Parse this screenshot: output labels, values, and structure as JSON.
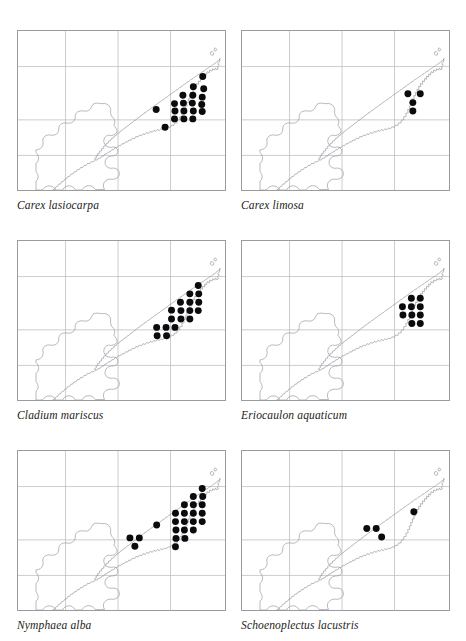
{
  "page": {
    "header_sliver_left": "",
    "header_sliver_mid": "",
    "header_sliver_right": "",
    "background_color": "#ffffff"
  },
  "style": {
    "dot_color": "#0b0b0d",
    "coastline_color": "#8e8e96",
    "gridline_color": "#b6b6bd",
    "panel_border_color": "#9a9aa2",
    "caption_color": "#1d1d20"
  },
  "map": {
    "type": "dot-distribution",
    "projection_grid": {
      "vertical_gridlines_x": [
        48,
        101,
        154
      ],
      "horizontal_gridlines_y": [
        36,
        90,
        126
      ],
      "grid_visible": true
    },
    "view_box": "0 0 209 161",
    "region_note": "archipelago outline: elongated NE-trending island plus south-western landmass"
  },
  "panels": [
    {
      "index": 1,
      "caption": "Carex lasiocarpa",
      "dot_count": 19,
      "dots": [
        {
          "x": 186.5,
          "y": 46.0
        },
        {
          "x": 177.0,
          "y": 56.5
        },
        {
          "x": 187.5,
          "y": 58.5
        },
        {
          "x": 166.5,
          "y": 65.0
        },
        {
          "x": 176.5,
          "y": 65.0
        },
        {
          "x": 186.0,
          "y": 67.0
        },
        {
          "x": 158.0,
          "y": 73.5
        },
        {
          "x": 167.0,
          "y": 73.0
        },
        {
          "x": 176.0,
          "y": 73.0
        },
        {
          "x": 185.5,
          "y": 74.5
        },
        {
          "x": 139.5,
          "y": 79.5
        },
        {
          "x": 158.5,
          "y": 81.0
        },
        {
          "x": 167.5,
          "y": 81.0
        },
        {
          "x": 177.0,
          "y": 81.0
        },
        {
          "x": 186.0,
          "y": 81.5
        },
        {
          "x": 158.0,
          "y": 89.0
        },
        {
          "x": 167.5,
          "y": 89.0
        },
        {
          "x": 176.5,
          "y": 89.0
        },
        {
          "x": 148.5,
          "y": 97.5
        }
      ]
    },
    {
      "index": 2,
      "caption": "Carex limosa",
      "dot_count": 4,
      "dots": [
        {
          "x": 167.5,
          "y": 63.5
        },
        {
          "x": 180.0,
          "y": 63.5
        },
        {
          "x": 172.5,
          "y": 72.5
        },
        {
          "x": 172.5,
          "y": 81.0
        }
      ]
    },
    {
      "index": 3,
      "caption": "Cladium mariscus",
      "dot_count": 18,
      "dots": [
        {
          "x": 182.0,
          "y": 45.0
        },
        {
          "x": 173.5,
          "y": 53.5
        },
        {
          "x": 182.5,
          "y": 53.5
        },
        {
          "x": 164.0,
          "y": 62.0
        },
        {
          "x": 173.5,
          "y": 62.0
        },
        {
          "x": 182.5,
          "y": 62.0
        },
        {
          "x": 155.0,
          "y": 70.0
        },
        {
          "x": 164.5,
          "y": 70.5
        },
        {
          "x": 173.5,
          "y": 70.5
        },
        {
          "x": 182.0,
          "y": 70.5
        },
        {
          "x": 155.0,
          "y": 79.0
        },
        {
          "x": 164.5,
          "y": 79.0
        },
        {
          "x": 173.5,
          "y": 79.0
        },
        {
          "x": 140.0,
          "y": 87.5
        },
        {
          "x": 149.5,
          "y": 87.5
        },
        {
          "x": 158.5,
          "y": 87.5
        },
        {
          "x": 140.5,
          "y": 96.0
        },
        {
          "x": 150.0,
          "y": 96.0
        }
      ]
    },
    {
      "index": 4,
      "caption": "Eriocaulon aquaticum",
      "dot_count": 10,
      "dots": [
        {
          "x": 171.0,
          "y": 58.0
        },
        {
          "x": 180.0,
          "y": 58.0
        },
        {
          "x": 162.0,
          "y": 66.5
        },
        {
          "x": 171.0,
          "y": 66.5
        },
        {
          "x": 180.0,
          "y": 66.5
        },
        {
          "x": 162.5,
          "y": 75.0
        },
        {
          "x": 171.5,
          "y": 75.0
        },
        {
          "x": 180.0,
          "y": 75.0
        },
        {
          "x": 171.5,
          "y": 83.5
        },
        {
          "x": 180.0,
          "y": 83.5
        }
      ]
    },
    {
      "index": 5,
      "caption": "Nymphaea alba",
      "dot_count": 24,
      "dots": [
        {
          "x": 186.0,
          "y": 38.0
        },
        {
          "x": 177.0,
          "y": 46.0
        },
        {
          "x": 186.5,
          "y": 46.0
        },
        {
          "x": 168.0,
          "y": 54.5
        },
        {
          "x": 177.0,
          "y": 54.5
        },
        {
          "x": 186.0,
          "y": 54.5
        },
        {
          "x": 159.0,
          "y": 63.0
        },
        {
          "x": 168.0,
          "y": 63.0
        },
        {
          "x": 177.0,
          "y": 63.0
        },
        {
          "x": 186.0,
          "y": 63.0
        },
        {
          "x": 159.0,
          "y": 71.5
        },
        {
          "x": 168.0,
          "y": 71.5
        },
        {
          "x": 177.0,
          "y": 71.5
        },
        {
          "x": 186.0,
          "y": 71.5
        },
        {
          "x": 140.0,
          "y": 75.0
        },
        {
          "x": 159.5,
          "y": 80.0
        },
        {
          "x": 168.0,
          "y": 80.0
        },
        {
          "x": 177.0,
          "y": 80.0
        },
        {
          "x": 113.0,
          "y": 88.0
        },
        {
          "x": 122.5,
          "y": 88.0
        },
        {
          "x": 159.5,
          "y": 88.5
        },
        {
          "x": 168.5,
          "y": 88.5
        },
        {
          "x": 118.0,
          "y": 96.5
        },
        {
          "x": 159.0,
          "y": 97.0
        }
      ]
    },
    {
      "index": 6,
      "caption": "Schoenoplectus lacustris",
      "dot_count": 4,
      "dots": [
        {
          "x": 173.5,
          "y": 61.5
        },
        {
          "x": 126.0,
          "y": 78.5
        },
        {
          "x": 135.5,
          "y": 78.5
        },
        {
          "x": 141.0,
          "y": 87.0
        }
      ]
    }
  ]
}
